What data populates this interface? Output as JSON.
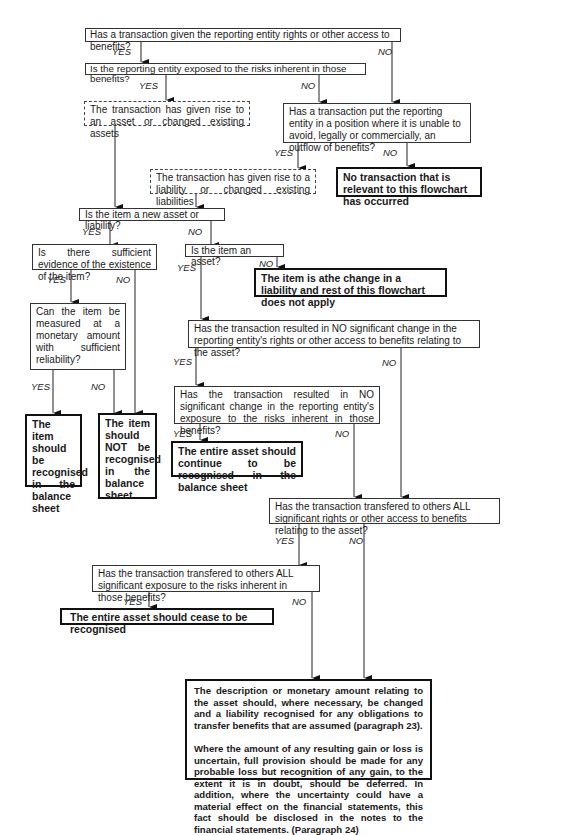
{
  "flowchart": {
    "q1": "Has a transaction given the reporting entity rights or other access to benefits?",
    "q2": "Is the reporting entity exposed to the risks inherent in those benefits?",
    "asset_dashed": "The transaction has given rise to an asset or changed existing assets",
    "q_outflow": "Has a transaction put the reporting entity in a position where it is unable to avoid, legally or commercially, an outflow of benefits?",
    "liability_dashed": "The transaction has given rise to a liability or changed existing liabilities",
    "no_transaction": "No transaction that is relevant to this flowchart has occurred",
    "q_new": "Is the item a new asset or liability?",
    "q_evidence": "Is there sufficient evidence of the existence of the item?",
    "q_is_asset": "Is the item an asset?",
    "liability_change": "The item is athe  change in a liability and rest of this flowchart does not apply",
    "q_measured": "Can the item be measured at a monetary amount with sufficient reliability?",
    "q_no_change_rights": "Has the transaction resulted in NO significant change in the reporting entity's rights or other access to benefits relating to the asset?",
    "q_no_change_exposure": "Has the transaction resulted in NO significant change in the reporting entity's exposure to the risks inherent in those benefits?",
    "recognised": "The item should be recognised in the balance sheet",
    "not_recognised": "The item should NOT be recognised in the balance sheet",
    "continue_recognised": "The entire asset should continue to be recognised in the balance sheet",
    "q_transfer_rights": "Has the transaction transfered to others ALL significant rights or other access to benefits relating to the asset?",
    "q_transfer_exposure": "Has the transaction transfered to others ALL significant exposure to the risks inherent in those benefits?",
    "cease_recognised": "The entire asset should cease to be recognised",
    "final_p1": "The description or monetary amount relating to the asset should, where necessary, be changed and a liability recognised for any obligations to transfer benefits that are assumed (paragraph 23).",
    "final_p2": "Where the amount of any resulting gain or loss is uncertain, full provision should be made for any probable loss but recognition of any gain, to the extent it is in doubt, should be deferred. In addition, where the uncertainty could have a material effect on the financial statements, this fact should be disclosed in the notes to the financial statements. (Paragraph 24)"
  },
  "labels": {
    "yes": "YES",
    "no": "NO"
  }
}
